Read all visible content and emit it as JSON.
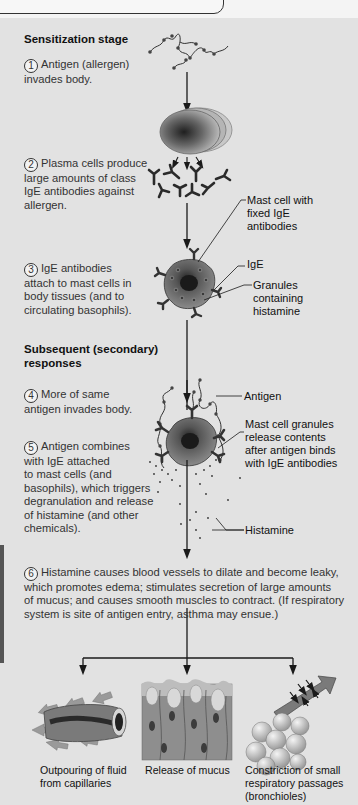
{
  "figure": {
    "sections": {
      "sensitization": "Sensitization stage",
      "subsequent_line1": "Subsequent (secondary)",
      "subsequent_line2": "responses"
    },
    "steps": [
      {
        "num": "1",
        "lines": [
          "Antigen (allergen)",
          "invades body."
        ]
      },
      {
        "num": "2",
        "lines": [
          "Plasma cells produce",
          "large amounts of class",
          "IgE antibodies against",
          "allergen."
        ]
      },
      {
        "num": "3",
        "lines": [
          "IgE antibodies",
          "attach to mast cells in",
          "body tissues  (and to",
          "circulating basophils)."
        ]
      },
      {
        "num": "4",
        "lines": [
          "More of same",
          "antigen invades body."
        ]
      },
      {
        "num": "5",
        "lines": [
          "Antigen combines",
          "with IgE attached",
          "to mast cells (and",
          "basophils), which triggers",
          "degranulation and release",
          "of histamine (and other",
          "chemicals)."
        ]
      },
      {
        "num": "6",
        "lines": [
          "Histamine causes blood vessels to dilate and become leaky,",
          "which promotes edema; stimulates secretion of large amounts",
          "of mucus; and causes smooth muscles to contract. (If respiratory",
          "system is site of antigen entry, asthma may ensue.)"
        ]
      }
    ],
    "labels": {
      "mast_cell": [
        "Mast cell with",
        "fixed IgE",
        "antibodies"
      ],
      "ige": "IgE",
      "granules": [
        "Granules",
        "containing",
        "histamine"
      ],
      "antigen": "Antigen",
      "mast_release": [
        "Mast cell granules",
        "release contents",
        "after antigen binds",
        "with IgE antibodies"
      ],
      "histamine": "Histamine"
    },
    "outcomes": [
      {
        "icon": "capillary-icon",
        "lines": [
          "Outpouring of fluid",
          "from capillaries"
        ]
      },
      {
        "icon": "mucus-tissue-icon",
        "lines": [
          "Release of mucus"
        ]
      },
      {
        "icon": "bronchiole-icon",
        "lines": [
          "Constriction of small",
          "respiratory passages",
          "(bronchioles)"
        ]
      }
    ],
    "colors": {
      "panel": "#e2e2e2",
      "text": "#333333",
      "arrow": "#1a1a1a"
    }
  }
}
